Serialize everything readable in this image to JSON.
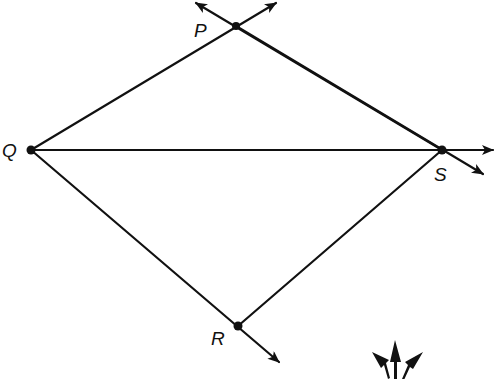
{
  "diagram": {
    "type": "geometry-rays",
    "points": {
      "P": {
        "label": "P",
        "x": 236,
        "y": 26
      },
      "Q": {
        "label": "Q",
        "x": 31,
        "y": 150
      },
      "S": {
        "label": "S",
        "x": 442,
        "y": 150
      },
      "R": {
        "label": "R",
        "x": 238,
        "y": 326
      }
    },
    "segments": [
      {
        "from": "Q",
        "to": "P"
      },
      {
        "from": "Q",
        "to": "S"
      },
      {
        "from": "Q",
        "to": "R"
      },
      {
        "from": "P",
        "to": "S"
      },
      {
        "from": "R",
        "to": "S"
      }
    ],
    "rays": [
      {
        "from": "Q",
        "through": "P",
        "note": "arrow beyond P"
      },
      {
        "from": "S",
        "through": "P",
        "note": "arrow beyond P"
      },
      {
        "from": "Q",
        "through": "S",
        "note": "arrow beyond S"
      },
      {
        "from": "P",
        "through": "S",
        "note": "arrow beyond S"
      },
      {
        "from": "Q",
        "through": "R",
        "note": "arrow beyond R"
      }
    ],
    "decoration": "triple-arrow glyph bottom-right (partially cropped)",
    "colors": {
      "stroke": "#111111",
      "background": "#ffffff"
    }
  }
}
